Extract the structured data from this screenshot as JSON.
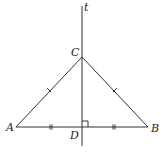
{
  "diagram": {
    "type": "geometry",
    "labels": {
      "line": "t",
      "apex": "C",
      "left": "A",
      "right": "B",
      "foot": "D"
    },
    "points": {
      "A": [
        16,
        127
      ],
      "B": [
        148,
        127
      ],
      "C": [
        82,
        57
      ],
      "D": [
        82,
        127
      ]
    },
    "line_t": {
      "x": 82,
      "y1": 6,
      "y2": 146
    },
    "marks": {
      "congruent_sides": [
        "AC",
        "BC"
      ],
      "congruent_segments": [
        "AD",
        "DB"
      ],
      "right_angle_at": "D"
    },
    "colors": {
      "stroke": "#333333",
      "background": "#ffffff"
    }
  }
}
